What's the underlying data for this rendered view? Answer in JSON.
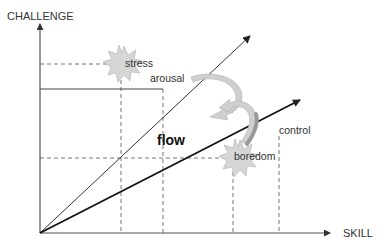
{
  "diagram": {
    "type": "flow-state-model",
    "axes": {
      "y_label": "CHALLENGE",
      "x_label": "SKILL"
    },
    "regions": {
      "flow": "flow"
    },
    "states": {
      "stress": "stress",
      "arousal": "arousal",
      "control": "control",
      "boredom": "boredom"
    },
    "colors": {
      "axis": "#555555",
      "line": "#222222",
      "dash": "#666666",
      "starburst_fill": "#d6d6d6",
      "starburst_stroke": "#aaaaaa",
      "curved_arrow_fill": "#cccccc",
      "curved_arrow_dark": "#999999"
    }
  }
}
